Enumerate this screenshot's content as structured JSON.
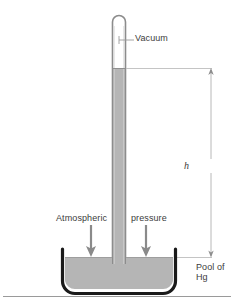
{
  "figure": {
    "labels": {
      "vacuum": "Vacuum",
      "atmospheric": "Atmospheric",
      "pressure": "pressure",
      "height_symbol": "h",
      "pool_line1": "Pool of",
      "pool_line2": "Hg"
    },
    "colors": {
      "mercury_fill": "#b5b5b5",
      "tube_wall": "#8c8c8c",
      "basin_outline": "#1a1a1a",
      "arrow_gray": "#8a8a8a",
      "dimension_line": "#b0b0b0",
      "leader_line": "#9a9a9a",
      "ground_line": "#9a9a9a",
      "text": "#3c3c3c",
      "background": "#ffffff"
    },
    "geometry": {
      "tube_left_x": 112,
      "tube_right_x": 126,
      "tube_top_y": 16,
      "mercury_top_y": 68,
      "pool_surface_y": 257,
      "basin_left_x": 62,
      "basin_right_x": 176,
      "basin_bottom_y": 291,
      "ground_line_y": 296,
      "dimension_x": 211,
      "height_top_y": 68,
      "height_bottom_y": 257,
      "arrow_left_x": 91,
      "arrow_right_x": 146,
      "arrow_top_y": 224,
      "arrow_bottom_y": 257
    }
  }
}
